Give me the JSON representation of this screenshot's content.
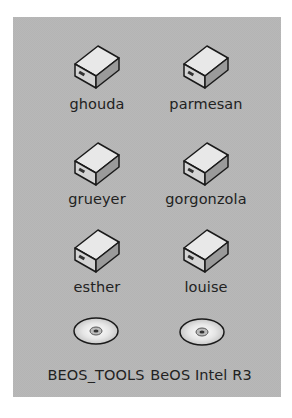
{
  "desktop": {
    "background": "#b4b4b4",
    "icons": [
      {
        "label": "ghouda",
        "type": "hard-drive"
      },
      {
        "label": "parmesan",
        "type": "hard-drive"
      },
      {
        "label": "grueyer",
        "type": "hard-drive"
      },
      {
        "label": "gorgonzola",
        "type": "hard-drive"
      },
      {
        "label": "esther",
        "type": "hard-drive"
      },
      {
        "label": "louise",
        "type": "hard-drive"
      },
      {
        "label": "BEOS_TOOLS",
        "type": "cd-rom"
      },
      {
        "label": "BeOS Intel R3",
        "type": "cd-rom"
      }
    ]
  }
}
